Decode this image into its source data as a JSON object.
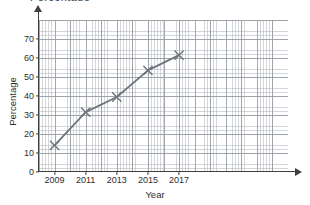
{
  "top_fragment": "Percentage",
  "chart_data": {
    "type": "line",
    "title": "",
    "xlabel": "Year",
    "ylabel": "Percentage",
    "x": [
      2009,
      2011,
      2013,
      2015,
      2017
    ],
    "values": [
      14,
      31.5,
      39.5,
      53.5,
      61.5
    ],
    "series": [
      {
        "name": "Percentage",
        "values": [
          14,
          31.5,
          39.5,
          53.5,
          61.5
        ]
      }
    ],
    "xlim": [
      2008,
      2018
    ],
    "ylim": [
      0,
      76
    ],
    "xticks": [
      2009,
      2011,
      2013,
      2015,
      2017
    ],
    "xtick_labels": [
      "2009",
      "2011",
      "2013",
      "2015",
      "2017"
    ],
    "yticks": [
      0,
      10,
      20,
      30,
      40,
      50,
      60,
      70
    ],
    "ytick_labels": [
      "0",
      "10",
      "20",
      "30",
      "40",
      "50",
      "60",
      "70"
    ],
    "grid": true,
    "grid_style": "graph-paper",
    "marker": "x",
    "legend": false,
    "line_color": "#6e747e",
    "marker_color": "#6e747e",
    "axis_color": "#3f3f3f",
    "grid_major_color": "#969ba2",
    "grid_minor_color": "#b0b5bc"
  }
}
